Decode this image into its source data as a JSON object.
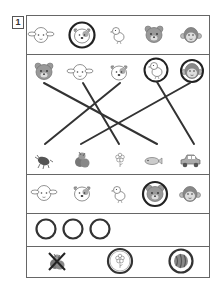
{
  "problem_number": "1",
  "rows": {
    "row1": {
      "items": [
        "sheep",
        "dog",
        "chick",
        "bear",
        "monkey"
      ],
      "circled": [
        "dog"
      ]
    },
    "row2_top": {
      "items": [
        "bear",
        "sheep",
        "dog",
        "chick",
        "monkey"
      ],
      "circled": [
        "chick",
        "monkey"
      ]
    },
    "row2_bottom": {
      "items": [
        "beetle",
        "vegetables",
        "flower",
        "fish",
        "car"
      ]
    },
    "row2_connections": [
      [
        "bear",
        "fish"
      ],
      [
        "sheep",
        "flower"
      ],
      [
        "dog",
        "beetle"
      ],
      [
        "chick",
        "car"
      ],
      [
        "monkey",
        "vegetables"
      ]
    ],
    "row3": {
      "items": [
        "sheep",
        "dog",
        "chick",
        "bear",
        "monkey"
      ],
      "circled": [
        "bear"
      ]
    },
    "row4": {
      "circles_count": 3
    },
    "row5": {
      "items": [
        "vegetables",
        "flower",
        "watermelon"
      ],
      "crossed": [
        "vegetables"
      ],
      "circled": [
        "flower",
        "watermelon"
      ]
    }
  }
}
